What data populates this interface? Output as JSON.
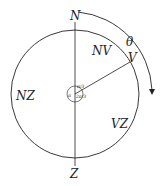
{
  "diagram": {
    "points": {
      "north": "N",
      "vertex": "V",
      "zenith": "Z"
    },
    "regions": {
      "nv": "NV",
      "nz": "NZ",
      "vz": "VZ"
    },
    "arc_angle_label": "θ",
    "center_angles": {
      "upper": "π/3",
      "left": "π",
      "lower": "2π/3"
    },
    "colors": {
      "stroke": "#222222",
      "background": "#ffffff"
    }
  }
}
